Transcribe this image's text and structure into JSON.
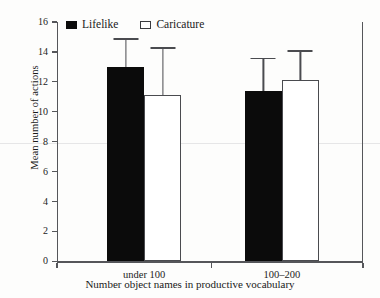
{
  "chart_data": {
    "type": "bar",
    "title": "",
    "subtitle": "",
    "xlabel": "Number object names in productive vocabulary",
    "ylabel": "Mean number of actions",
    "categories": [
      "under 100",
      "100–200"
    ],
    "series": [
      {
        "name": "Lifelike",
        "values": [
          13.0,
          11.4
        ],
        "errors_upper": [
          1.9,
          2.2
        ],
        "color": "#0b0b0b",
        "fill": "solid"
      },
      {
        "name": "Caricature",
        "values": [
          11.1,
          12.1
        ],
        "errors_upper": [
          3.2,
          2.0
        ],
        "color": "#ffffff",
        "fill": "hollow"
      }
    ],
    "ylim": [
      0,
      16
    ],
    "yticks": [
      0,
      2,
      4,
      6,
      8,
      10,
      12,
      14,
      16
    ],
    "ytick_labels": [
      "0",
      "2",
      "4",
      "6",
      "8",
      "10",
      "12",
      "14",
      "16"
    ],
    "grid": false,
    "legend_position": "top-left-inside",
    "error_bar_style": "upper-only-with-caps"
  },
  "legend": {
    "entries": [
      {
        "label": "Lifelike",
        "swatch": "filled-square-icon"
      },
      {
        "label": "Caricature",
        "swatch": "hollow-square-icon"
      }
    ]
  },
  "axes": {
    "y_title": "Mean number of actions",
    "x_title": "Number object names in productive vocabulary"
  }
}
